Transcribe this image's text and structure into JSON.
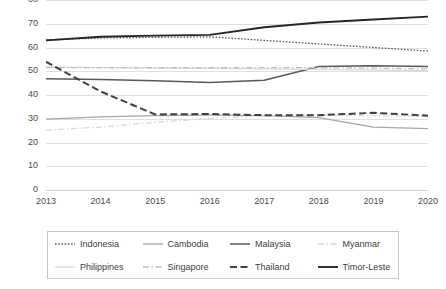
{
  "chart_data": {
    "type": "line",
    "title": "",
    "xlabel": "",
    "ylabel": "",
    "x": [
      2013,
      2014,
      2015,
      2016,
      2017,
      2018,
      2019,
      2020
    ],
    "categories": [
      "2013",
      "2014",
      "2015",
      "2016",
      "2017",
      "2018",
      "2019",
      "2020"
    ],
    "ylim": [
      0,
      80
    ],
    "ytick_step": 10,
    "yticks": [
      80,
      70,
      60,
      50,
      40,
      30,
      20,
      10,
      0
    ],
    "ytick_labels": [
      "80",
      "70",
      "60",
      "50",
      "40",
      "30",
      "20",
      "10",
      "0"
    ],
    "grid": true,
    "grid_axis": "y",
    "legend_position": "bottom",
    "legend_columns": 4,
    "series": [
      {
        "name": "Indonesia",
        "values": [
          63.2,
          64.0,
          64.3,
          64.5,
          63.0,
          61.5,
          60.0,
          58.5
        ],
        "color": "#595959",
        "style": "dotted",
        "width": 1.3
      },
      {
        "name": "Cambodia",
        "values": [
          29.8,
          30.8,
          31.3,
          31.5,
          31.3,
          30.5,
          26.5,
          25.8
        ],
        "color": "#a6a6a6",
        "style": "solid",
        "width": 1.3
      },
      {
        "name": "Malaysia",
        "values": [
          46.8,
          46.5,
          46.0,
          45.3,
          46.2,
          52.0,
          52.3,
          52.0
        ],
        "color": "#595959",
        "style": "solid",
        "width": 1.5
      },
      {
        "name": "Myanmar",
        "values": [
          25.2,
          26.5,
          28.5,
          30.2,
          31.2,
          31.5,
          31.3,
          31.0
        ],
        "color": "#d9d9d9",
        "style": "dashdot",
        "width": 1.3
      },
      {
        "name": "Philippines",
        "values": [
          51.8,
          51.5,
          51.3,
          51.2,
          51.0,
          50.8,
          50.5,
          50.2
        ],
        "color": "#d9d9d9",
        "style": "solid",
        "width": 1.3
      },
      {
        "name": "Singapore",
        "values": [
          51.5,
          51.5,
          51.5,
          51.5,
          51.5,
          51.5,
          51.3,
          51.0
        ],
        "color": "#bfbfbf",
        "style": "dashdot",
        "width": 1.3
      },
      {
        "name": "Thailand",
        "values": [
          54.0,
          41.5,
          31.8,
          32.0,
          31.5,
          31.5,
          32.5,
          31.3
        ],
        "color": "#404040",
        "style": "dashed",
        "width": 2.0
      },
      {
        "name": "Timor-Leste",
        "values": [
          63.0,
          64.5,
          65.0,
          65.3,
          68.5,
          70.5,
          71.8,
          73.0
        ],
        "color": "#262626",
        "style": "solid",
        "width": 1.9
      }
    ]
  },
  "legend": {
    "entries": [
      {
        "label": "Indonesia"
      },
      {
        "label": "Cambodia"
      },
      {
        "label": "Malaysia"
      },
      {
        "label": "Myanmar"
      },
      {
        "label": "Philippines"
      },
      {
        "label": "Singapore"
      },
      {
        "label": "Thailand"
      },
      {
        "label": "Timor-Leste"
      }
    ]
  }
}
